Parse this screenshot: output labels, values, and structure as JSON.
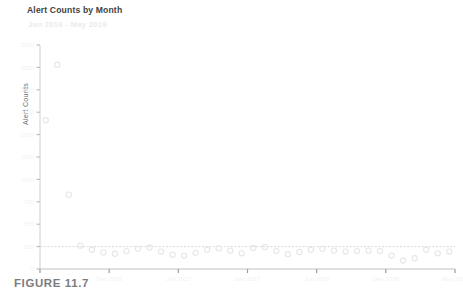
{
  "figure": {
    "caption": "FIGURE 11.7"
  },
  "chart_data": {
    "type": "scatter",
    "title": "Alert Counts by Month",
    "subtitle": "Jun 2016 - May 2019",
    "xlabel": "",
    "ylabel": "Alert Counts",
    "grid": false,
    "legend": "none",
    "accent_color": "#d9dde2",
    "point_color": "#e4e7ea",
    "axis_color": "#c9c9cc",
    "reference_line": {
      "value": 250,
      "style": "dashed",
      "color": "#d2d6da",
      "label": ""
    },
    "ylim": [
      0,
      2500
    ],
    "yticks": [
      0,
      250,
      500,
      750,
      1000,
      1250,
      1500,
      1750,
      2000,
      2250,
      2500
    ],
    "ytick_labels": [
      "0",
      "250",
      "500",
      "750",
      "1000",
      "1250",
      "1500",
      "1750",
      "2000",
      "2250",
      "2500"
    ],
    "xlim": [
      0,
      36
    ],
    "xticks": [
      0,
      6,
      12,
      18,
      24,
      30,
      36
    ],
    "xtick_labels": [
      "Jun 2016",
      "Dec 2016",
      "Jun 2017",
      "Dec 2017",
      "Jun 2018",
      "Dec 2018",
      "May 2019"
    ],
    "categories": [
      "Jun 2016",
      "Jul 2016",
      "Aug 2016",
      "Sep 2016",
      "Oct 2016",
      "Nov 2016",
      "Dec 2016",
      "Jan 2017",
      "Feb 2017",
      "Mar 2017",
      "Apr 2017",
      "May 2017",
      "Jun 2017",
      "Jul 2017",
      "Aug 2017",
      "Sep 2017",
      "Oct 2017",
      "Nov 2017",
      "Dec 2017",
      "Jan 2018",
      "Feb 2018",
      "Mar 2018",
      "Apr 2018",
      "May 2018",
      "Jun 2018",
      "Jul 2018",
      "Aug 2018",
      "Sep 2018",
      "Oct 2018",
      "Nov 2018",
      "Dec 2018",
      "Jan 2019",
      "Feb 2019",
      "Mar 2019",
      "Apr 2019",
      "May 2019"
    ],
    "values": [
      1660,
      2280,
      830,
      260,
      215,
      185,
      170,
      200,
      225,
      240,
      195,
      160,
      150,
      180,
      215,
      230,
      205,
      175,
      235,
      245,
      200,
      165,
      190,
      215,
      225,
      205,
      195,
      200,
      205,
      200,
      150,
      95,
      120,
      215,
      175,
      195
    ]
  }
}
